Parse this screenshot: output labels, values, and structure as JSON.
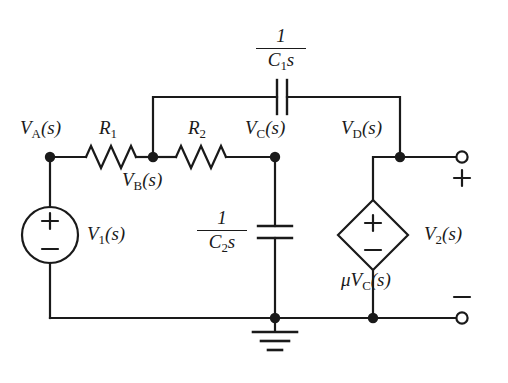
{
  "figure": {
    "type": "circuit-schematic",
    "background": "#ffffff",
    "ink_color": "#1a1a1a",
    "width": 508,
    "height": 383
  },
  "nodes": {
    "a": {
      "name": "V_A(s)",
      "base": "V",
      "sub": "A",
      "arg": "(s)",
      "x": 50,
      "y": 157
    },
    "b": {
      "name": "V_B(s)",
      "base": "V",
      "sub": "B",
      "arg": "(s)",
      "x": 153,
      "y": 157
    },
    "c": {
      "name": "V_C(s)",
      "base": "V",
      "sub": "C",
      "arg": "(s)",
      "x": 275,
      "y": 157
    },
    "d": {
      "name": "V_D(s)",
      "base": "V",
      "sub": "D",
      "arg": "(s)",
      "x": 400,
      "y": 157
    }
  },
  "components": {
    "r1": {
      "label_base": "R",
      "label_sub": "1",
      "x": 110,
      "y": 157
    },
    "r2": {
      "label_base": "R",
      "label_sub": "2",
      "x": 200,
      "y": 157
    },
    "c1": {
      "numerator": "1",
      "den_base": "C",
      "den_sub": "1",
      "den_tail": "s",
      "x": 281,
      "y": 97
    },
    "c2": {
      "numerator": "1",
      "den_base": "C",
      "den_sub": "2",
      "den_tail": "s",
      "x": 275,
      "y": 235
    },
    "source_v1": {
      "base": "V",
      "sub": "1",
      "arg": "(s)",
      "plus": "+",
      "minus": "−",
      "x": 50,
      "y": 235
    },
    "dependent_source": {
      "label_mu": "μ",
      "label_base": "V",
      "label_sub": "C",
      "label_arg": "(s)",
      "plus": "+",
      "minus": "−",
      "x": 373,
      "y": 235
    },
    "ground": {
      "x": 275,
      "y": 318
    }
  },
  "output_port": {
    "label_base": "V",
    "label_sub": "2",
    "label_arg": "(s)",
    "plus": "+",
    "minus": "−",
    "top_terminal_x": 462,
    "top_terminal_y": 157,
    "bottom_terminal_x": 462,
    "bottom_terminal_y": 318
  },
  "labels": {
    "va": "V",
    "va_sub": "A",
    "vb": "V",
    "vb_sub": "B",
    "vc": "V",
    "vc_sub": "C",
    "vd": "V",
    "vd_sub": "D",
    "paren_s": "(s)",
    "r1": "R",
    "r1_sub": "1",
    "r2": "R",
    "r2_sub": "2",
    "one": "1",
    "cap_c": "C",
    "c1_sub": "1",
    "c2_sub": "2",
    "s_italic": "s",
    "v1": "V",
    "v1_sub": "1",
    "v2": "V",
    "v2_sub": "2",
    "mu": "μ",
    "plus": "+",
    "minus": "−"
  }
}
